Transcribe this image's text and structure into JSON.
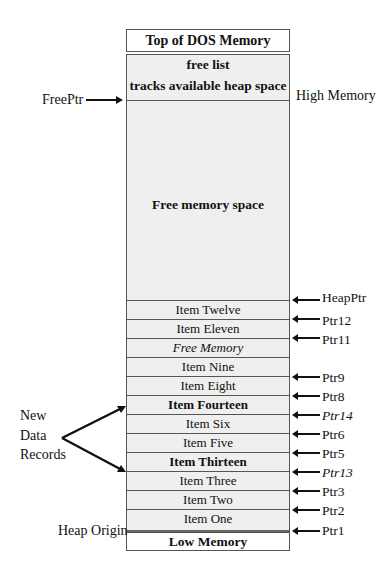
{
  "diagram": {
    "top_block": "Top of DOS Memory",
    "free_list_title": "free list",
    "free_list_desc": "tracks available heap space",
    "free_space_label": "Free memory space",
    "low_block": "Low  Memory",
    "left_labels": {
      "free_ptr": "FreePtr",
      "new_records": [
        "New",
        "Data",
        "Records"
      ],
      "heap_origin": "Heap Origin"
    },
    "right_labels": {
      "high_memory": "High Memory"
    },
    "rows": [
      {
        "label": "Item Twelve",
        "style": "normal"
      },
      {
        "label": "Item Eleven",
        "style": "normal"
      },
      {
        "label": "Free Memory",
        "style": "italic"
      },
      {
        "label": "Item Nine",
        "style": "normal"
      },
      {
        "label": "Item Eight",
        "style": "normal"
      },
      {
        "label": "Item Fourteen",
        "style": "bold"
      },
      {
        "label": "Item Six",
        "style": "normal"
      },
      {
        "label": "Item Five",
        "style": "normal"
      },
      {
        "label": "Item Thirteen",
        "style": "bold"
      },
      {
        "label": "Item Three",
        "style": "normal"
      },
      {
        "label": "Item Two",
        "style": "normal"
      },
      {
        "label": "Item One",
        "style": "normal"
      }
    ],
    "pointers": [
      {
        "label": "HeapPtr",
        "style": "normal"
      },
      {
        "label": "Ptr12",
        "style": "normal"
      },
      {
        "label": "Ptr11",
        "style": "normal"
      },
      {
        "label": "Ptr9",
        "style": "normal"
      },
      {
        "label": "Ptr8",
        "style": "normal"
      },
      {
        "label": "Ptr14",
        "style": "italic"
      },
      {
        "label": "Ptr6",
        "style": "normal"
      },
      {
        "label": "Ptr5",
        "style": "normal"
      },
      {
        "label": "Ptr13",
        "style": "italic"
      },
      {
        "label": "Ptr3",
        "style": "normal"
      },
      {
        "label": "Ptr2",
        "style": "normal"
      },
      {
        "label": "Ptr1",
        "style": "normal"
      }
    ]
  }
}
